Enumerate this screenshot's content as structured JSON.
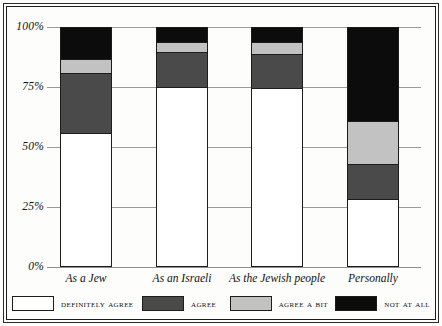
{
  "chart_data": {
    "type": "bar",
    "subtype": "stacked-bar-100",
    "title": "",
    "xlabel": "",
    "ylabel": "",
    "ylim": [
      0,
      100
    ],
    "grid": true,
    "legend_position": "bottom",
    "categories": [
      "As a Jew",
      "As an Israeli",
      "As the Jewish people",
      "Personally"
    ],
    "y_ticks": [
      "0%",
      "25%",
      "50%",
      "75%",
      "100%"
    ],
    "y_tick_values": [
      0,
      25,
      50,
      75,
      100
    ],
    "series": [
      {
        "name": "Definitely agree",
        "color": "#ffffff",
        "values": [
          56,
          75,
          75,
          28
        ]
      },
      {
        "name": "Agree",
        "color": "#4a4a4a",
        "values": [
          25,
          15,
          14,
          15
        ]
      },
      {
        "name": "Agree a bit",
        "color": "#c2c2c2",
        "values": [
          6,
          4,
          5,
          18
        ]
      },
      {
        "name": "Not at all",
        "color": "#0c0c0c",
        "values": [
          13,
          6,
          6,
          39
        ]
      }
    ]
  },
  "axis": {
    "y_labels": [
      {
        "text": "100%",
        "value": 100
      },
      {
        "text": "75%",
        "value": 75
      },
      {
        "text": "50%",
        "value": 50
      },
      {
        "text": "25%",
        "value": 25
      },
      {
        "text": "0%",
        "value": 0
      }
    ],
    "x_labels": [
      "As a Jew",
      "As an Israeli",
      "As the Jewish people",
      "Personally"
    ]
  },
  "legend": {
    "items": [
      {
        "label": "Definitely agree",
        "swatch": "white-swatch",
        "color": "#ffffff"
      },
      {
        "label": "Agree",
        "swatch": "dark-gray-swatch",
        "color": "#4a4a4a"
      },
      {
        "label": "Agree a bit",
        "swatch": "light-gray-swatch",
        "color": "#c2c2c2"
      },
      {
        "label": "Not at all",
        "swatch": "black-swatch",
        "color": "#0c0c0c"
      }
    ]
  },
  "colors": {
    "definitely_agree": "#ffffff",
    "agree": "#4a4a4a",
    "agree_a_bit": "#c2c2c2",
    "not_at_all": "#0c0c0c",
    "frame": "#1a1a1a",
    "gridline": "#9a9a9a"
  }
}
